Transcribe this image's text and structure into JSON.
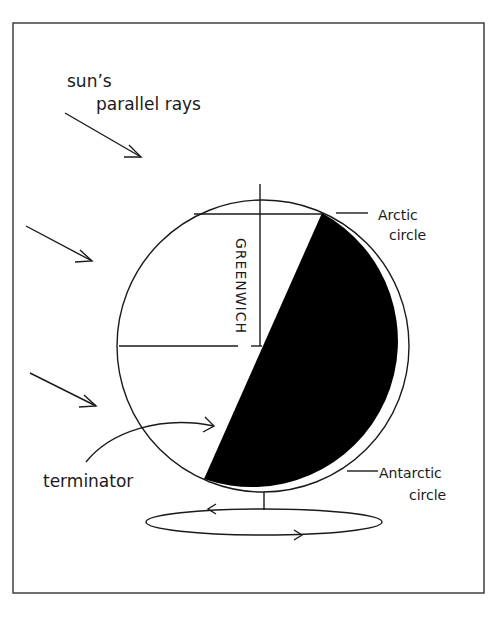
{
  "diagram": {
    "labels": {
      "sun_line1": "sun’s",
      "sun_line2": "parallel rays",
      "arctic_line1": "Arctic",
      "arctic_line2": "circle",
      "greenwich": "GREENWICH",
      "terminator": "terminator",
      "antarctic_line1": "Antarctic",
      "antarctic_line2": "circle"
    },
    "colors": {
      "ink": "#1a1a1a",
      "night_side": "#000000",
      "background": "#ffffff"
    }
  }
}
